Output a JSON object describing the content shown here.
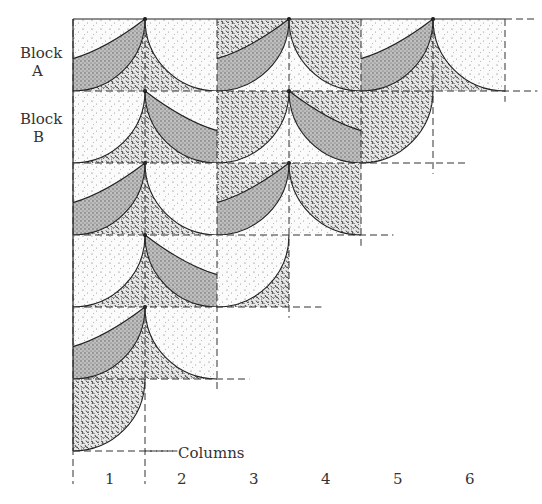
{
  "diagram": {
    "row_labels": [
      {
        "word": "Block",
        "letter": "A"
      },
      {
        "word": "Block",
        "letter": "B"
      }
    ],
    "axis_label": "Columns",
    "columns": [
      "1",
      "2",
      "3",
      "4",
      "5",
      "6"
    ],
    "textures": {
      "light": "light-dots",
      "band": "gray-band",
      "mottled": "dense-mottled"
    },
    "rows": [
      {
        "type": "A",
        "blocks": [
          {
            "cols": [
              1,
              2
            ],
            "variant": 1
          },
          {
            "cols": [
              3,
              4
            ],
            "variant": 2
          },
          {
            "cols": [
              5,
              6
            ],
            "variant": 1
          }
        ]
      },
      {
        "type": "B",
        "blocks": [
          {
            "cols": [
              1,
              2
            ],
            "variant": 1
          },
          {
            "cols": [
              3,
              4
            ],
            "variant": 2
          },
          {
            "cols": [
              5
            ],
            "variant": "quarter"
          }
        ]
      },
      {
        "type": "A",
        "blocks": [
          {
            "cols": [
              1,
              2
            ],
            "variant": 1
          },
          {
            "cols": [
              3,
              4
            ],
            "variant": 2
          }
        ]
      },
      {
        "type": "B",
        "blocks": [
          {
            "cols": [
              1,
              2
            ],
            "variant": 1
          },
          {
            "cols": [
              3
            ],
            "variant": "quarter"
          }
        ]
      },
      {
        "type": "A",
        "blocks": [
          {
            "cols": [
              1,
              2
            ],
            "variant": 1
          }
        ]
      },
      {
        "type": "B",
        "blocks": [
          {
            "cols": [
              1
            ],
            "variant": "quarter"
          }
        ]
      }
    ]
  }
}
